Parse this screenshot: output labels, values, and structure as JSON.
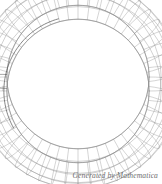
{
  "figure": {
    "kind": "3d-wireframe-plot",
    "title": "",
    "background_color": "#ffffff",
    "width": 162,
    "height": 184
  },
  "caption": {
    "text": "Generated by Mathematica",
    "color": "#6e6e6e",
    "align": "right"
  },
  "chart_data": {
    "type": "scatter",
    "title": "",
    "subtitle": "",
    "xlabel": "",
    "ylabel": "",
    "surface": "torus",
    "render_style": "wireframe-mesh",
    "grid": true,
    "legend": false,
    "axes_visible": false,
    "bounding_box_visible": false,
    "shading": "none",
    "line_color": "#8a8a8a",
    "line_color_dark": "#4a4a4a",
    "line_width": 0.5,
    "fill_color": "#ffffff",
    "projection": {
      "view_point": [
        0.0,
        -0.35,
        2.6
      ],
      "description": "near-overhead oblique view",
      "tilt_ratio": 0.86,
      "center_x": 78,
      "center_y": 84
    },
    "geometry": {
      "major_radius_px_x": 73,
      "major_radius_px_y": 76,
      "tube_radius_px": 30,
      "inner_hole_rx": 29,
      "inner_hole_ry": 35,
      "u_segments": 48,
      "v_segments": 20,
      "u_range_deg": [
        0,
        360
      ],
      "v_range_deg": [
        0,
        360
      ]
    },
    "mesh_counts": {
      "meridian_lines": 48,
      "circumferential_lines": 9,
      "visible_quad_rows": 8
    },
    "highlight": {
      "name": "fold-seam-arc",
      "start_angle_deg": 150,
      "end_angle_deg": 255,
      "color": "#4a4a4a"
    },
    "cut_section": {
      "name": "tube-cross-section",
      "angle_deg": 182,
      "visible": true
    },
    "axis_ranges": {
      "x": [
        -1.33,
        1.33
      ],
      "y": [
        -1.33,
        1.33
      ],
      "z": [
        -0.33,
        0.33
      ]
    }
  }
}
